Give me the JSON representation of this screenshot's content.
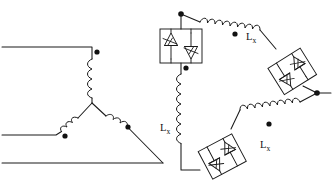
{
  "diagram": {
    "type": "electrical-schematic",
    "colors": {
      "line": "#1a1a1a",
      "background": "#ffffff",
      "dot": "#111111"
    },
    "left_network": {
      "name": "wye-star-connected-winding",
      "description": "Three-phase star (wye) connected transformer windings with polarity dots",
      "neutral_point": {
        "x": 92,
        "y": 103
      },
      "terminals": [
        {
          "name": "phase-a-terminal",
          "label": "",
          "x": 0,
          "y": 47
        },
        {
          "name": "phase-b-terminal",
          "label": "",
          "x": 0,
          "y": 135
        },
        {
          "name": "phase-c-terminal",
          "label": "",
          "x": 0,
          "y": 163
        }
      ],
      "windings": [
        {
          "name": "winding-a",
          "orientation": "vertical",
          "dot": {
            "x": 97,
            "y": 52
          }
        },
        {
          "name": "winding-b",
          "orientation": "diagonal-down-left",
          "dot": {
            "x": 65,
            "y": 136
          }
        },
        {
          "name": "winding-c",
          "orientation": "diagonal-down-right",
          "dot": {
            "x": 128,
            "y": 127
          }
        }
      ]
    },
    "right_network": {
      "name": "delta-connected-tcr",
      "description": "Delta-connected thyristor-controlled reactor with three Lx inductors and three anti-parallel thyristor pairs",
      "vertices": [
        {
          "name": "vertex-top",
          "x": 181,
          "y": 14
        },
        {
          "name": "vertex-right",
          "x": 317,
          "y": 93
        },
        {
          "name": "vertex-bottom-left",
          "x": 181,
          "y": 170
        }
      ],
      "reactors": [
        {
          "name": "reactor-top",
          "label": "L",
          "subscript": "x",
          "label_x": 247,
          "label_y": 36,
          "dot": {
            "x": 235,
            "y": 34
          }
        },
        {
          "name": "reactor-left",
          "label": "L",
          "subscript": "x",
          "label_x": 163,
          "label_y": 128,
          "dot": {
            "x": 186,
            "y": 68
          }
        },
        {
          "name": "reactor-bottom",
          "label": "L",
          "subscript": "x",
          "label_x": 261,
          "label_y": 144,
          "dot": {
            "x": 269,
            "y": 124
          }
        }
      ],
      "switches": [
        {
          "name": "thyristor-pair-upper-left",
          "orientation": "vertical",
          "cx": 181,
          "cy": 46
        },
        {
          "name": "thyristor-pair-right",
          "orientation": "rotated",
          "cx": 292,
          "cy": 71,
          "rotation": -32
        },
        {
          "name": "thyristor-pair-bottom",
          "orientation": "rotated",
          "cx": 222,
          "cy": 156,
          "rotation": -28
        }
      ],
      "output_terminal": {
        "name": "delta-output-terminal",
        "x": 332,
        "y": 93,
        "dot": {
          "x": 317,
          "y": 93
        }
      }
    }
  }
}
